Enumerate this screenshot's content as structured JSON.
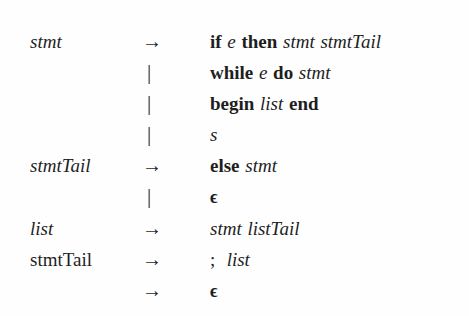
{
  "figure": {
    "kind": "grammar-production-rules",
    "notation": "BNF",
    "background_color": "#fefefe",
    "text_color": "#1e1e1e"
  },
  "symbols": {
    "arrow": "→",
    "alternation_bar": "|",
    "epsilon": "ϵ"
  },
  "rows": [
    {
      "lhs": "stmt",
      "lhs_style": "italic",
      "op": "arrow",
      "rhs_text": "if e then stmt stmtTail",
      "rhs_tokens": [
        {
          "text": "if",
          "style": "keyword"
        },
        {
          "text": "e",
          "style": "italic"
        },
        {
          "text": "then",
          "style": "keyword"
        },
        {
          "text": "stmt",
          "style": "italic"
        },
        {
          "text": "stmtTail",
          "style": "italic"
        }
      ]
    },
    {
      "lhs": "",
      "lhs_style": "italic",
      "op": "bar",
      "rhs_text": "while e do stmt",
      "rhs_tokens": [
        {
          "text": "while",
          "style": "keyword"
        },
        {
          "text": "e",
          "style": "italic"
        },
        {
          "text": "do",
          "style": "keyword"
        },
        {
          "text": "stmt",
          "style": "italic"
        }
      ]
    },
    {
      "lhs": "",
      "lhs_style": "italic",
      "op": "bar",
      "rhs_text": "begin list end",
      "rhs_tokens": [
        {
          "text": "begin",
          "style": "keyword"
        },
        {
          "text": "list",
          "style": "italic"
        },
        {
          "text": "end",
          "style": "keyword"
        }
      ]
    },
    {
      "lhs": "",
      "lhs_style": "italic",
      "op": "bar",
      "rhs_text": "s",
      "rhs_tokens": [
        {
          "text": "s",
          "style": "italic"
        }
      ]
    },
    {
      "lhs": "stmtTail",
      "lhs_style": "italic",
      "op": "arrow",
      "rhs_text": "else stmt",
      "rhs_tokens": [
        {
          "text": "else",
          "style": "keyword"
        },
        {
          "text": "stmt",
          "style": "italic"
        }
      ]
    },
    {
      "lhs": "",
      "lhs_style": "italic",
      "op": "bar",
      "rhs_text": "ϵ",
      "rhs_tokens": [
        {
          "text": "ϵ",
          "style": "epsilon"
        }
      ]
    },
    {
      "lhs": "list",
      "lhs_style": "italic",
      "op": "arrow",
      "rhs_text": "stmt listTail",
      "rhs_tokens": [
        {
          "text": "stmt",
          "style": "italic"
        },
        {
          "text": "listTail",
          "style": "italic"
        }
      ]
    },
    {
      "lhs": "stmtTail",
      "lhs_style": "roman",
      "op": "arrow",
      "rhs_text": "; list",
      "rhs_tokens": [
        {
          "text": ";",
          "style": "punct"
        },
        {
          "text": "list",
          "style": "italic"
        }
      ]
    },
    {
      "lhs": "",
      "lhs_style": "italic",
      "op": "arrow",
      "rhs_text": "ϵ",
      "rhs_tokens": [
        {
          "text": "ϵ",
          "style": "epsilon"
        }
      ]
    }
  ]
}
